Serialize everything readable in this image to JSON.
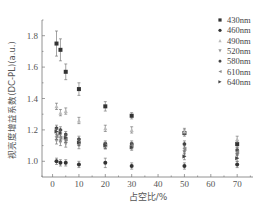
{
  "chart_data": {
    "type": "scatter",
    "title": "",
    "xlabel": "占空比/%",
    "ylabel": "视亮度增益系数(DC-PL)(a.u.)",
    "xlim": [
      -4,
      76
    ],
    "ylim": [
      0.9,
      1.9
    ],
    "xticks": [
      0,
      10,
      20,
      30,
      40,
      50,
      60,
      70
    ],
    "yticks": [
      1.0,
      1.2,
      1.4,
      1.6,
      1.8
    ],
    "grid": false,
    "legend_position": "upper right",
    "series": [
      {
        "name": "430nm",
        "marker": "square",
        "color": "#333333",
        "x": [
          1.5,
          3,
          5,
          10,
          20,
          30,
          50,
          70
        ],
        "values": [
          1.75,
          1.71,
          1.57,
          1.46,
          1.35,
          1.29,
          1.18,
          1.11
        ],
        "err": [
          0.08,
          0.07,
          0.05,
          0.04,
          0.03,
          0.02,
          0.02,
          0.02
        ]
      },
      {
        "name": "460nm",
        "marker": "circle",
        "color": "#333333",
        "x": [
          1.5,
          3,
          5,
          10,
          20,
          30,
          50,
          70
        ],
        "values": [
          1.0,
          0.99,
          0.99,
          0.98,
          0.99,
          0.97,
          0.97,
          0.98
        ],
        "err": [
          0.02,
          0.02,
          0.02,
          0.02,
          0.03,
          0.02,
          0.02,
          0.02
        ]
      },
      {
        "name": "490nm",
        "marker": "triangle-up",
        "color": "#bbbbbb",
        "x": [
          1.5,
          3,
          5,
          10,
          20,
          30,
          50,
          70
        ],
        "values": [
          1.35,
          1.31,
          1.32,
          1.26,
          1.21,
          1.2,
          1.19,
          1.14
        ],
        "err": [
          0.02,
          0.02,
          0.02,
          0.02,
          0.02,
          0.02,
          0.02,
          0.02
        ]
      },
      {
        "name": "520nm",
        "marker": "triangle-down",
        "color": "#999999",
        "x": [
          1.5,
          3,
          5,
          10,
          20,
          30,
          50,
          70
        ],
        "values": [
          1.13,
          1.12,
          1.11,
          1.1,
          1.1,
          1.1,
          1.06,
          1.04
        ],
        "err": [
          0.02,
          0.02,
          0.02,
          0.02,
          0.02,
          0.02,
          0.02,
          0.02
        ]
      },
      {
        "name": "580nm",
        "marker": "hexagon",
        "color": "#444444",
        "x": [
          1.5,
          3,
          5,
          10,
          20,
          30,
          50,
          70
        ],
        "values": [
          1.21,
          1.2,
          1.17,
          1.14,
          1.11,
          1.11,
          1.11,
          1.07
        ],
        "err": [
          0.02,
          0.02,
          0.02,
          0.02,
          0.02,
          0.02,
          0.02,
          0.02
        ]
      },
      {
        "name": "610nm",
        "marker": "triangle-left",
        "color": "#888888",
        "x": [
          1.5,
          3,
          5,
          10,
          20,
          30,
          50,
          70
        ],
        "values": [
          1.16,
          1.15,
          1.14,
          1.12,
          1.1,
          1.1,
          1.08,
          1.06
        ],
        "err": [
          0.02,
          0.02,
          0.02,
          0.02,
          0.02,
          0.02,
          0.02,
          0.02
        ]
      },
      {
        "name": "640nm",
        "marker": "triangle-right",
        "color": "#444444",
        "x": [
          1.5,
          3,
          5,
          10,
          20,
          30,
          50,
          70
        ],
        "values": [
          1.19,
          1.18,
          1.15,
          1.12,
          1.1,
          1.09,
          1.03,
          1.02
        ],
        "err": [
          0.02,
          0.02,
          0.02,
          0.02,
          0.02,
          0.02,
          0.02,
          0.02
        ]
      }
    ]
  },
  "axes": {
    "xlabel": "占空比/%",
    "ylabel": "视亮度增益系数(DC-PL)(a.u.)"
  },
  "legend": {
    "items": [
      "430nm",
      "460nm",
      "490nm",
      "520nm",
      "580nm",
      "610nm",
      "640nm"
    ]
  }
}
